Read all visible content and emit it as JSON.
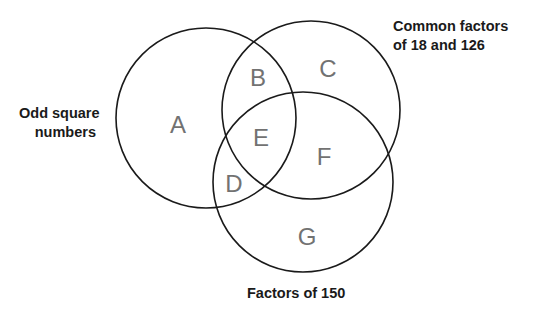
{
  "diagram": {
    "type": "venn",
    "sets": [
      {
        "id": "odd",
        "label_lines": [
          "Odd square",
          "numbers"
        ],
        "circle": {
          "cx": 206,
          "cy": 118,
          "r": 90
        }
      },
      {
        "id": "common",
        "label_lines": [
          "Common factors",
          "of 18 and 126"
        ],
        "circle": {
          "cx": 311,
          "cy": 110,
          "r": 89
        }
      },
      {
        "id": "factors150",
        "label_lines": [
          "Factors of 150"
        ],
        "circle": {
          "cx": 303,
          "cy": 182,
          "r": 90
        }
      }
    ],
    "regions": [
      {
        "letter": "A",
        "x": 178,
        "y": 124,
        "sets": [
          "odd"
        ]
      },
      {
        "letter": "B",
        "x": 258,
        "y": 77,
        "sets": [
          "odd",
          "common"
        ]
      },
      {
        "letter": "C",
        "x": 328,
        "y": 68,
        "sets": [
          "common"
        ]
      },
      {
        "letter": "D",
        "x": 234,
        "y": 183,
        "sets": [
          "odd",
          "factors150"
        ]
      },
      {
        "letter": "E",
        "x": 261,
        "y": 137,
        "sets": [
          "odd",
          "common",
          "factors150"
        ]
      },
      {
        "letter": "F",
        "x": 324,
        "y": 156,
        "sets": [
          "common",
          "factors150"
        ]
      },
      {
        "letter": "G",
        "x": 307,
        "y": 236,
        "sets": [
          "factors150"
        ]
      }
    ],
    "colors": {
      "stroke": "#1a1a1a",
      "label_text": "#1a1a1a",
      "region_letter": "#727272",
      "background": "#ffffff"
    }
  },
  "labels": {
    "odd_line1": "Odd square",
    "odd_line2": "numbers",
    "common_line1": "Common factors",
    "common_line2": "of 18 and 126",
    "factors150": "Factors of 150"
  },
  "letters": {
    "A": "A",
    "B": "B",
    "C": "C",
    "D": "D",
    "E": "E",
    "F": "F",
    "G": "G"
  }
}
